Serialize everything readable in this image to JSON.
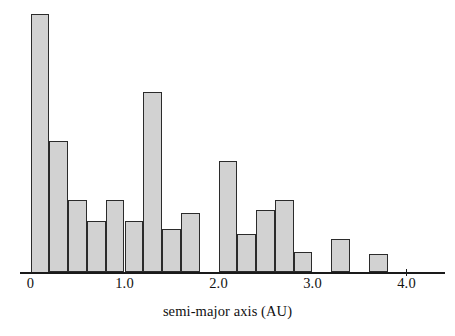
{
  "chart_data": {
    "type": "bar",
    "title": "",
    "subtitle": "",
    "xlabel": "semi-major axis (AU)",
    "ylabel": "",
    "grid": false,
    "legend": null,
    "xlim": [
      -0.07,
      4.4
    ],
    "ylim": [
      0,
      100
    ],
    "bin_width": 0.2,
    "xticks": [
      {
        "value": 0,
        "label": "0"
      },
      {
        "value": 1.0,
        "label": "1.0"
      },
      {
        "value": 2.0,
        "label": "2.0"
      },
      {
        "value": 3.0,
        "label": "3.0"
      },
      {
        "value": 4.0,
        "label": "4.0"
      }
    ],
    "yticks": [],
    "bin_edges": [
      0.0,
      0.2,
      0.4,
      0.6,
      0.8,
      1.0,
      1.2,
      1.4,
      1.6,
      1.8,
      2.0,
      2.2,
      2.4,
      2.6,
      2.8,
      3.0,
      3.2,
      3.4,
      3.6,
      3.8
    ],
    "categories": [
      "0.0-0.2",
      "0.2-0.4",
      "0.4-0.6",
      "0.6-0.8",
      "0.8-1.0",
      "1.0-1.2",
      "1.2-1.4",
      "1.4-1.6",
      "1.6-1.8",
      "1.8-2.0",
      "2.0-2.2",
      "2.2-2.4",
      "2.4-2.6",
      "2.6-2.8",
      "2.8-3.0",
      "3.0-3.2",
      "3.2-3.4",
      "3.4-3.6",
      "3.6-3.8"
    ],
    "values": [
      100,
      51,
      28,
      20,
      28,
      20,
      70,
      17,
      23,
      0,
      43,
      15,
      24,
      28,
      8,
      0,
      13,
      0,
      7
    ],
    "annotations": []
  },
  "axis": {
    "x_label_text": "semi-major axis (AU)"
  }
}
